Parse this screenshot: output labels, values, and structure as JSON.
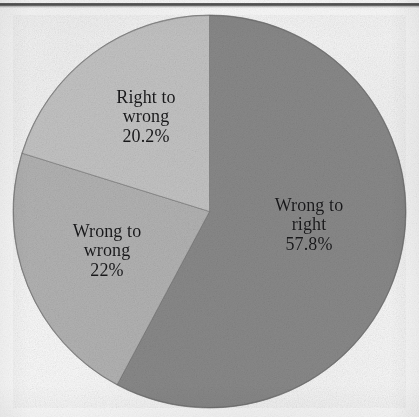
{
  "figure": {
    "has_top_rule": true,
    "background_color": "#fbfbfb"
  },
  "chart_data": {
    "type": "pie",
    "title": "",
    "xlabel": "",
    "ylabel": "",
    "legend_position": "none",
    "labels_inside_slices": true,
    "start_angle_deg": 0,
    "direction": "clockwise",
    "categories": [
      "Wrong to right",
      "Wrong to wrong",
      "Right to wrong"
    ],
    "values": [
      57.8,
      22.0,
      20.2
    ],
    "value_labels": [
      "57.8%",
      "22%",
      "20.2%"
    ],
    "colors": [
      "#8a8a8a",
      "#b4b4b4",
      "#c5c5c5"
    ],
    "slices": [
      {
        "name": "Wrong to right",
        "value": 57.8,
        "value_label": "57.8%",
        "color": "#8a8a8a",
        "label_line1": "Wrong to",
        "label_line2": "right",
        "start_deg": 0,
        "end_deg": 208.08
      },
      {
        "name": "Wrong to wrong",
        "value": 22.0,
        "value_label": "22%",
        "color": "#b4b4b4",
        "label_line1": "Wrong to",
        "label_line2": "wrong",
        "start_deg": 208.08,
        "end_deg": 287.28
      },
      {
        "name": "Right to wrong",
        "value": 20.2,
        "value_label": "20.2%",
        "color": "#c5c5c5",
        "label_line1": "Right to",
        "label_line2": "wrong",
        "start_deg": 287.28,
        "end_deg": 360
      }
    ]
  }
}
